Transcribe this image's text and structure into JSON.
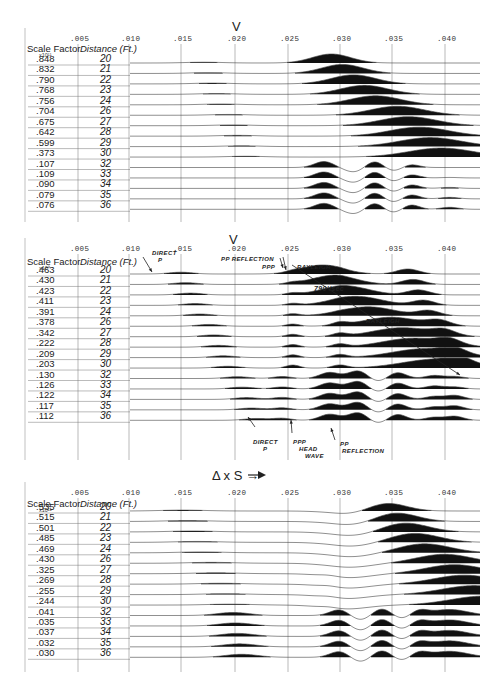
{
  "chart_data": [
    {
      "type": "line",
      "title": "V",
      "xlabel": "Time (sec)",
      "x_ticks": [
        ".005",
        ".010",
        ".015",
        ".020",
        ".025",
        ".030",
        ".035",
        ".040"
      ],
      "xlim": [
        0.0,
        0.043
      ],
      "grid": true,
      "row_headers": {
        "scale_factor": "Scale Factor",
        "exponent": "x10¹¹",
        "distance": "Distance (Ft.)"
      },
      "rows": [
        {
          "scale_factor": ".848",
          "distance": "20"
        },
        {
          "scale_factor": ".832",
          "distance": "21"
        },
        {
          "scale_factor": ".790",
          "distance": "22"
        },
        {
          "scale_factor": ".768",
          "distance": "23"
        },
        {
          "scale_factor": ".756",
          "distance": "24"
        },
        {
          "scale_factor": ".704",
          "distance": "26"
        },
        {
          "scale_factor": ".675",
          "distance": "27"
        },
        {
          "scale_factor": ".642",
          "distance": "28"
        },
        {
          "scale_factor": ".599",
          "distance": "29"
        },
        {
          "scale_factor": ".373",
          "distance": "30"
        },
        {
          "scale_factor": ".107",
          "distance": "32"
        },
        {
          "scale_factor": ".109",
          "distance": "33"
        },
        {
          "scale_factor": ".090",
          "distance": "34"
        },
        {
          "scale_factor": ".079",
          "distance": "35"
        },
        {
          "scale_factor": ".076",
          "distance": "36"
        }
      ],
      "annotations": []
    },
    {
      "type": "line",
      "title": "V",
      "xlabel": "Time (sec)",
      "x_ticks": [
        ".005",
        ".010",
        ".015",
        ".020",
        ".025",
        ".030",
        ".035",
        ".040"
      ],
      "xlim": [
        0.0,
        0.043
      ],
      "grid": true,
      "row_headers": {
        "scale_factor": "Scale Factor",
        "exponent": "x10⁹",
        "distance": "Distance (Ft.)"
      },
      "rows": [
        {
          "scale_factor": ".463",
          "distance": "20"
        },
        {
          "scale_factor": ".430",
          "distance": "21"
        },
        {
          "scale_factor": ".423",
          "distance": "22"
        },
        {
          "scale_factor": ".411",
          "distance": "23"
        },
        {
          "scale_factor": ".391",
          "distance": "24"
        },
        {
          "scale_factor": ".378",
          "distance": "26"
        },
        {
          "scale_factor": ".342",
          "distance": "27"
        },
        {
          "scale_factor": ".222",
          "distance": "28"
        },
        {
          "scale_factor": ".209",
          "distance": "29"
        },
        {
          "scale_factor": ".203",
          "distance": "30"
        },
        {
          "scale_factor": ".130",
          "distance": "32"
        },
        {
          "scale_factor": ".126",
          "distance": "33"
        },
        {
          "scale_factor": ".122",
          "distance": "34"
        },
        {
          "scale_factor": ".117",
          "distance": "35"
        },
        {
          "scale_factor": ".112",
          "distance": "36"
        }
      ],
      "annotations": [
        {
          "text": "DIRECT P",
          "x": 0.013
        },
        {
          "text": "PP REFLECTION",
          "x": 0.021
        },
        {
          "text": "PPP",
          "x": 0.024
        },
        {
          "text": "RAYLEIGH",
          "x": 0.027
        },
        {
          "text": "790'/sec",
          "x": 0.03
        },
        {
          "text": "RAYLEIGH",
          "x": 0.033
        },
        {
          "text": "DIRECT P",
          "x": 0.022
        },
        {
          "text": "PPP HEAD WAVE",
          "x": 0.026
        },
        {
          "text": "PP REFLECTION",
          "x": 0.029
        }
      ]
    },
    {
      "type": "line",
      "title": "Δ x S →",
      "xlabel": "Time (sec)",
      "x_ticks": [
        ".005",
        ".010",
        ".015",
        ".020",
        ".025",
        ".030",
        ".035",
        ".040"
      ],
      "xlim": [
        0.0,
        0.043
      ],
      "grid": true,
      "row_headers": {
        "scale_factor": "Scale Factor",
        "exponent": "x10¹¹",
        "distance": "Distance (Ft.)"
      },
      "rows": [
        {
          "scale_factor": ".535",
          "distance": "20"
        },
        {
          "scale_factor": ".515",
          "distance": "21"
        },
        {
          "scale_factor": ".501",
          "distance": "22"
        },
        {
          "scale_factor": ".485",
          "distance": "23"
        },
        {
          "scale_factor": ".469",
          "distance": "24"
        },
        {
          "scale_factor": ".430",
          "distance": "26"
        },
        {
          "scale_factor": ".325",
          "distance": "27"
        },
        {
          "scale_factor": ".269",
          "distance": "28"
        },
        {
          "scale_factor": ".255",
          "distance": "29"
        },
        {
          "scale_factor": ".244",
          "distance": "30"
        },
        {
          "scale_factor": ".041",
          "distance": "32"
        },
        {
          "scale_factor": ".035",
          "distance": "33"
        },
        {
          "scale_factor": ".037",
          "distance": "34"
        },
        {
          "scale_factor": ".032",
          "distance": "35"
        },
        {
          "scale_factor": ".030",
          "distance": "36"
        }
      ],
      "annotations": []
    }
  ],
  "panels": [
    {
      "title": "V",
      "top": 15,
      "tickY": 38,
      "hdrY": 43,
      "row0": 59,
      "rowStep": 10.45,
      "gridBottom": 222
    },
    {
      "title": "V",
      "top": 232,
      "tickY": 248,
      "hdrY": 256,
      "row0": 270,
      "rowStep": 10.45,
      "gridBottom": 460
    },
    {
      "title": "Δ x S →",
      "top": 455,
      "tickY": 492,
      "hdrY": 498,
      "row0": 507,
      "rowStep": 10.45,
      "gridBottom": 672
    }
  ]
}
